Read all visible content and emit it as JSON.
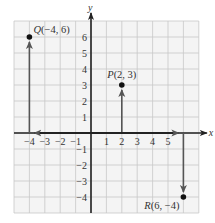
{
  "diagram": {
    "type": "coordinate-plane",
    "axes": {
      "x_label": "x",
      "y_label": "y"
    },
    "x_range": [
      -4,
      6
    ],
    "y_range": [
      -4,
      6
    ],
    "x_ticks": [
      "-4",
      "-3",
      "-2",
      "-1",
      "1",
      "2",
      "3",
      "4",
      "5"
    ],
    "y_ticks": [
      "6",
      "5",
      "4",
      "3",
      "2",
      "1",
      "-1",
      "-2",
      "-3",
      "-4"
    ],
    "points": [
      {
        "name": "Q",
        "x": -4,
        "y": 6,
        "label": "Q(−4, 6)"
      },
      {
        "name": "P",
        "x": 2,
        "y": 3,
        "label": "P(2, 3)"
      },
      {
        "name": "R",
        "x": 6,
        "y": -4,
        "label": "R(6, −4)"
      }
    ],
    "colors": {
      "grid": "#c8c8c8",
      "grid_bg": "#f4f4f4",
      "axis": "#222222",
      "arrow": "#555555",
      "point": "#111111"
    }
  }
}
